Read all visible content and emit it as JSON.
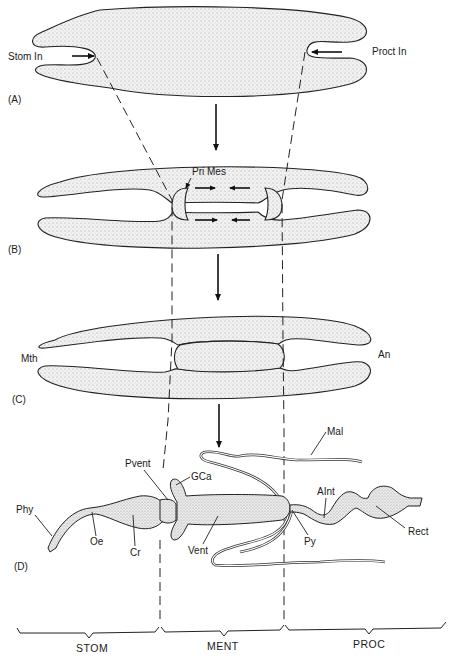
{
  "figure": {
    "panels": [
      {
        "id": "A",
        "label": "(A)",
        "annotations": [
          "Stom In",
          "Proct In"
        ]
      },
      {
        "id": "B",
        "label": "(B)",
        "annotations": [
          "Pri Mes"
        ]
      },
      {
        "id": "C",
        "label": "(C)",
        "annotations": [
          "Mth",
          "An"
        ]
      },
      {
        "id": "D",
        "label": "(D)",
        "annotations": [
          "Phy",
          "Oe",
          "Cr",
          "Pvent",
          "GCa",
          "Vent",
          "Py",
          "Mal",
          "AInt",
          "Rect"
        ]
      }
    ],
    "labels": {
      "stom_in": "Stom In",
      "proct_in": "Proct In",
      "pri_mes": "Pri Mes",
      "mth": "Mth",
      "an": "An",
      "phy": "Phy",
      "oe": "Oe",
      "cr": "Cr",
      "pvent": "Pvent",
      "gca": "GCa",
      "vent": "Vent",
      "py": "Py",
      "mal": "Mal",
      "aint": "AInt",
      "rect": "Rect"
    },
    "panel_labels": {
      "a": "(A)",
      "b": "(B)",
      "c": "(C)",
      "d": "(D)"
    },
    "regions": [
      {
        "key": "stom",
        "label": "STOM"
      },
      {
        "key": "ment",
        "label": "MENT"
      },
      {
        "key": "proc",
        "label": "PROC"
      }
    ],
    "colors": {
      "ink": "#1a1a1a",
      "background": "#ffffff",
      "stipple": "#cfcfcf"
    }
  }
}
